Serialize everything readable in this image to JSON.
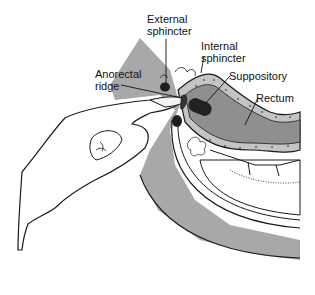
{
  "diagram": {
    "labels": {
      "external_sphincter": "External\nsphincter",
      "internal_sphincter": "Internal\nsphincter",
      "anorectal_ridge": "Anorectal\nridge",
      "suppository": "Suppository",
      "rectum": "Rectum"
    },
    "colors": {
      "tissue_gray": "#a8a8a8",
      "rectum_fill": "#8f8f8f",
      "wall_fill": "#c4c4c4",
      "outline": "#1a1a1a",
      "suppository": "#222222",
      "sphincter": "#1e1e1e",
      "background": "#ffffff"
    }
  }
}
